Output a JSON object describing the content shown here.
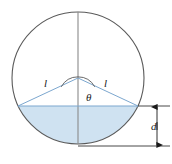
{
  "figure": {
    "labels": {
      "leg_left": "l",
      "leg_right": "l",
      "angle": "θ",
      "depth": "d"
    },
    "colors": {
      "outline": "#5a5a5a",
      "construction_line": "#7f7f7f",
      "chord": "#7ca7cf",
      "fill": "#cfe2f1",
      "dimension": "#1a1a1a"
    },
    "geometry": {
      "circle_center_x": 78,
      "circle_center_y": 78,
      "circle_radius": 66,
      "chord_y": 106,
      "chord_left_x": 18,
      "chord_right_x": 138,
      "apex_x": 78,
      "apex_y": 78,
      "angle_arc_radius": 19,
      "dimension_x": 157,
      "dimension_top_y": 106,
      "dimension_bottom_y": 146
    },
    "elements": {
      "circle": "tank-circle",
      "vertical_diameter": "vertical-diameter-line",
      "chord": "liquid-surface-chord",
      "segment": "liquid-segment-fill",
      "leg_left": "triangle-leg-left",
      "leg_right": "triangle-leg-right",
      "angle_arc": "angle-arc",
      "dimension": "depth-dimension-line"
    }
  }
}
